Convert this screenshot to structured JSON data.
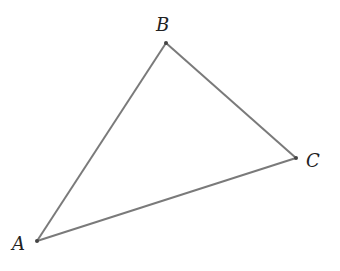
{
  "diagram": {
    "title": "",
    "type": "triangle",
    "stroke_color": "#7a7a7a",
    "point_color": "#444444",
    "vertices": [
      {
        "name": "A",
        "label": "A",
        "x": 37,
        "y": 241,
        "label_x": 12,
        "label_y": 250
      },
      {
        "name": "B",
        "label": "B",
        "x": 166,
        "y": 43,
        "label_x": 156,
        "label_y": 31
      },
      {
        "name": "C",
        "label": "C",
        "x": 296,
        "y": 158,
        "label_x": 306,
        "label_y": 167
      }
    ],
    "edges": [
      {
        "from": "A",
        "to": "B"
      },
      {
        "from": "B",
        "to": "C"
      },
      {
        "from": "C",
        "to": "A"
      }
    ]
  }
}
